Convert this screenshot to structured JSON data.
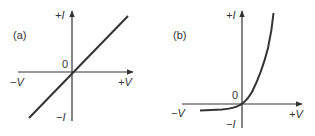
{
  "figure": {
    "panels": [
      {
        "id": "a",
        "label": "(a)",
        "origin_label": "0",
        "axis_labels": {
          "pos_i": "+I",
          "neg_i": "−I",
          "pos_v": "+V",
          "neg_v": "−V"
        },
        "curve": "linear",
        "description": "Ohmic (linear) current-voltage characteristic through origin"
      },
      {
        "id": "b",
        "label": "(b)",
        "origin_label": "0",
        "axis_labels": {
          "pos_i": "+I",
          "neg_i": "−I",
          "pos_v": "+V",
          "neg_v": "−V"
        },
        "curve": "exponential",
        "description": "Diode (non-linear) current-voltage characteristic: small reverse current, exponential forward current"
      }
    ],
    "colors": {
      "ink": "#333333",
      "background": "#ffffff"
    }
  }
}
